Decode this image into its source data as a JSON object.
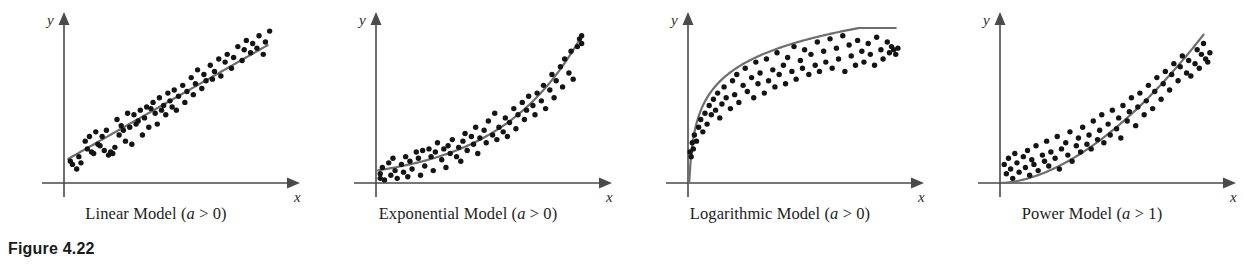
{
  "figure": {
    "number_label": "Figure 4.22",
    "axis_x_label": "x",
    "axis_y_label": "y",
    "curve_color": "#6e6e6e",
    "point_color": "#141414",
    "axis_color": "#4a4a4a",
    "background_color": "#ffffff"
  },
  "panels": [
    {
      "id": "linear",
      "caption_prefix": "Linear Model (",
      "caption_param": "a",
      "caption_suffix": " > 0)",
      "caption_full": "Linear Model (a > 0)"
    },
    {
      "id": "exponential",
      "caption_prefix": "Exponential Model (",
      "caption_param": "a",
      "caption_suffix": " > 0)",
      "caption_full": "Exponential Model (a > 0)"
    },
    {
      "id": "logarithmic",
      "caption_prefix": "Logarithmic Model (",
      "caption_param": "a",
      "caption_suffix": " > 0)",
      "caption_full": "Logarithmic Model (a > 0)"
    },
    {
      "id": "power",
      "caption_prefix": "Power Model (",
      "caption_param": "a",
      "caption_suffix": " > 1)",
      "caption_full": "Power Model (a > 1)"
    }
  ],
  "chart_data": [
    {
      "type": "scatter",
      "id": "linear",
      "title": "Linear Model (a > 0)",
      "xlabel": "x",
      "ylabel": "y",
      "xlim": [
        0,
        100
      ],
      "ylim": [
        0,
        100
      ],
      "grid": false,
      "legend": null,
      "annotation": "a > 0",
      "fit": {
        "name": "linear fit",
        "equation": "y = a*x + b",
        "a": 0.78,
        "b": 14,
        "color": "#6e6e6e",
        "x_start": 2,
        "x_end": 96
      },
      "points": [
        [
          3,
          14
        ],
        [
          4,
          12
        ],
        [
          6,
          9
        ],
        [
          7,
          17
        ],
        [
          8,
          13
        ],
        [
          10,
          27
        ],
        [
          11,
          22
        ],
        [
          12,
          30
        ],
        [
          13,
          20
        ],
        [
          14,
          19
        ],
        [
          15,
          33
        ],
        [
          16,
          25
        ],
        [
          17,
          24
        ],
        [
          18,
          30
        ],
        [
          19,
          21
        ],
        [
          20,
          34
        ],
        [
          21,
          18
        ],
        [
          22,
          20
        ],
        [
          23,
          19
        ],
        [
          24,
          23
        ],
        [
          25,
          41
        ],
        [
          26,
          31
        ],
        [
          27,
          37
        ],
        [
          28,
          34
        ],
        [
          29,
          27
        ],
        [
          30,
          45
        ],
        [
          31,
          36
        ],
        [
          32,
          25
        ],
        [
          33,
          44
        ],
        [
          34,
          38
        ],
        [
          35,
          40
        ],
        [
          36,
          47
        ],
        [
          37,
          31
        ],
        [
          38,
          42
        ],
        [
          39,
          49
        ],
        [
          40,
          36
        ],
        [
          41,
          48
        ],
        [
          42,
          52
        ],
        [
          43,
          45
        ],
        [
          44,
          38
        ],
        [
          45,
          55
        ],
        [
          46,
          47
        ],
        [
          47,
          50
        ],
        [
          48,
          44
        ],
        [
          49,
          58
        ],
        [
          50,
          53
        ],
        [
          51,
          49
        ],
        [
          52,
          60
        ],
        [
          53,
          47
        ],
        [
          54,
          56
        ],
        [
          56,
          63
        ],
        [
          57,
          52
        ],
        [
          58,
          59
        ],
        [
          60,
          68
        ],
        [
          61,
          57
        ],
        [
          62,
          64
        ],
        [
          63,
          73
        ],
        [
          65,
          61
        ],
        [
          66,
          70
        ],
        [
          67,
          66
        ],
        [
          69,
          76
        ],
        [
          70,
          67
        ],
        [
          71,
          72
        ],
        [
          73,
          80
        ],
        [
          74,
          69
        ],
        [
          76,
          78
        ],
        [
          77,
          83
        ],
        [
          79,
          74
        ],
        [
          80,
          81
        ],
        [
          82,
          88
        ],
        [
          84,
          79
        ],
        [
          85,
          86
        ],
        [
          86,
          92
        ],
        [
          88,
          84
        ],
        [
          89,
          90
        ],
        [
          91,
          87
        ],
        [
          92,
          95
        ],
        [
          94,
          83
        ],
        [
          95,
          91
        ],
        [
          97,
          98
        ]
      ]
    },
    {
      "type": "scatter",
      "id": "exponential",
      "title": "Exponential Model (a > 0)",
      "xlabel": "x",
      "ylabel": "y",
      "xlim": [
        0,
        100
      ],
      "ylim": [
        0,
        100
      ],
      "grid": false,
      "legend": null,
      "annotation": "a > 0",
      "fit": {
        "name": "exponential fit",
        "equation": "y = a*exp(b*x)",
        "a": 8,
        "b": 0.0255,
        "color": "#6e6e6e",
        "x_start": 1,
        "x_end": 97
      },
      "points": [
        [
          2,
          6
        ],
        [
          2,
          3
        ],
        [
          3,
          10
        ],
        [
          4,
          2
        ],
        [
          6,
          13
        ],
        [
          7,
          5
        ],
        [
          8,
          16
        ],
        [
          9,
          8
        ],
        [
          10,
          3
        ],
        [
          12,
          12
        ],
        [
          13,
          7
        ],
        [
          14,
          17
        ],
        [
          15,
          4
        ],
        [
          16,
          14
        ],
        [
          17,
          9
        ],
        [
          19,
          20
        ],
        [
          20,
          16
        ],
        [
          21,
          5
        ],
        [
          22,
          21
        ],
        [
          23,
          11
        ],
        [
          25,
          22
        ],
        [
          26,
          17
        ],
        [
          27,
          8
        ],
        [
          28,
          20
        ],
        [
          29,
          26
        ],
        [
          31,
          15
        ],
        [
          32,
          22
        ],
        [
          33,
          10
        ],
        [
          34,
          24
        ],
        [
          35,
          19
        ],
        [
          36,
          28
        ],
        [
          38,
          17
        ],
        [
          39,
          23
        ],
        [
          40,
          14
        ],
        [
          41,
          27
        ],
        [
          42,
          32
        ],
        [
          43,
          21
        ],
        [
          45,
          30
        ],
        [
          46,
          25
        ],
        [
          47,
          36
        ],
        [
          48,
          19
        ],
        [
          49,
          29
        ],
        [
          51,
          34
        ],
        [
          52,
          26
        ],
        [
          53,
          40
        ],
        [
          55,
          31
        ],
        [
          56,
          45
        ],
        [
          57,
          28
        ],
        [
          58,
          36
        ],
        [
          60,
          33
        ],
        [
          61,
          42
        ],
        [
          62,
          30
        ],
        [
          63,
          39
        ],
        [
          65,
          48
        ],
        [
          66,
          35
        ],
        [
          67,
          44
        ],
        [
          69,
          52
        ],
        [
          70,
          41
        ],
        [
          71,
          47
        ],
        [
          72,
          56
        ],
        [
          74,
          50
        ],
        [
          75,
          44
        ],
        [
          76,
          58
        ],
        [
          78,
          53
        ],
        [
          79,
          63
        ],
        [
          80,
          48
        ],
        [
          82,
          60
        ],
        [
          83,
          70
        ],
        [
          84,
          55
        ],
        [
          85,
          66
        ],
        [
          87,
          75
        ],
        [
          88,
          62
        ],
        [
          89,
          80
        ],
        [
          91,
          71
        ],
        [
          92,
          85
        ],
        [
          93,
          67
        ],
        [
          95,
          88
        ],
        [
          96,
          93
        ],
        [
          97,
          95
        ],
        [
          97,
          90
        ]
      ]
    },
    {
      "type": "scatter",
      "id": "logarithmic",
      "title": "Logarithmic Model (a > 0)",
      "xlabel": "x",
      "ylabel": "y",
      "xlim": [
        0,
        100
      ],
      "ylim": [
        0,
        100
      ],
      "grid": false,
      "legend": null,
      "annotation": "a > 0",
      "fit": {
        "name": "logarithmic fit",
        "equation": "y = a*ln(x) + b",
        "a": 20.5,
        "b": 10,
        "color": "#6e6e6e",
        "x_start": 0.55,
        "x_end": 98
      },
      "points": [
        [
          1,
          20
        ],
        [
          1.5,
          17
        ],
        [
          2,
          26
        ],
        [
          2.5,
          22
        ],
        [
          3,
          31
        ],
        [
          4,
          27
        ],
        [
          5,
          36
        ],
        [
          6,
          41
        ],
        [
          7,
          33
        ],
        [
          8,
          45
        ],
        [
          9,
          38
        ],
        [
          10,
          50
        ],
        [
          11,
          44
        ],
        [
          12,
          54
        ],
        [
          13,
          47
        ],
        [
          14,
          58
        ],
        [
          15,
          42
        ],
        [
          16,
          51
        ],
        [
          17,
          62
        ],
        [
          18,
          55
        ],
        [
          20,
          48
        ],
        [
          21,
          66
        ],
        [
          22,
          57
        ],
        [
          23,
          70
        ],
        [
          24,
          52
        ],
        [
          26,
          63
        ],
        [
          27,
          74
        ],
        [
          28,
          59
        ],
        [
          30,
          68
        ],
        [
          31,
          55
        ],
        [
          32,
          78
        ],
        [
          33,
          64
        ],
        [
          34,
          71
        ],
        [
          36,
          58
        ],
        [
          37,
          80
        ],
        [
          38,
          66
        ],
        [
          40,
          73
        ],
        [
          41,
          62
        ],
        [
          42,
          84
        ],
        [
          43,
          70
        ],
        [
          45,
          76
        ],
        [
          46,
          64
        ],
        [
          47,
          81
        ],
        [
          49,
          72
        ],
        [
          50,
          88
        ],
        [
          51,
          67
        ],
        [
          53,
          79
        ],
        [
          54,
          74
        ],
        [
          55,
          86
        ],
        [
          57,
          70
        ],
        [
          58,
          83
        ],
        [
          60,
          76
        ],
        [
          61,
          91
        ],
        [
          62,
          72
        ],
        [
          64,
          85
        ],
        [
          65,
          78
        ],
        [
          67,
          93
        ],
        [
          68,
          74
        ],
        [
          70,
          87
        ],
        [
          71,
          80
        ],
        [
          73,
          95
        ],
        [
          74,
          72
        ],
        [
          76,
          89
        ],
        [
          77,
          82
        ],
        [
          79,
          76
        ],
        [
          80,
          92
        ],
        [
          82,
          85
        ],
        [
          83,
          78
        ],
        [
          85,
          90
        ],
        [
          86,
          83
        ],
        [
          88,
          76
        ],
        [
          89,
          94
        ],
        [
          91,
          86
        ],
        [
          92,
          80
        ],
        [
          94,
          91
        ],
        [
          95,
          84
        ],
        [
          96,
          88
        ],
        [
          97,
          86
        ],
        [
          98,
          83
        ],
        [
          99,
          87
        ]
      ]
    },
    {
      "type": "scatter",
      "id": "power",
      "title": "Power Model (a > 1)",
      "xlabel": "x",
      "ylabel": "y",
      "xlim": [
        0,
        100
      ],
      "ylim": [
        0,
        100
      ],
      "grid": false,
      "legend": null,
      "annotation": "a > 1",
      "fit": {
        "name": "power fit",
        "equation": "y = c*x^a",
        "a": 1.75,
        "c": 0.0325,
        "color": "#6e6e6e",
        "x_start": 1,
        "x_end": 96
      },
      "points": [
        [
          2,
          12
        ],
        [
          3,
          6
        ],
        [
          4,
          16
        ],
        [
          5,
          9
        ],
        [
          6,
          3
        ],
        [
          7,
          19
        ],
        [
          8,
          13
        ],
        [
          9,
          7
        ],
        [
          11,
          17
        ],
        [
          12,
          10
        ],
        [
          13,
          21
        ],
        [
          14,
          5
        ],
        [
          15,
          15
        ],
        [
          16,
          12
        ],
        [
          17,
          24
        ],
        [
          18,
          8
        ],
        [
          20,
          18
        ],
        [
          21,
          14
        ],
        [
          22,
          27
        ],
        [
          23,
          11
        ],
        [
          24,
          20
        ],
        [
          26,
          16
        ],
        [
          27,
          30
        ],
        [
          28,
          9
        ],
        [
          29,
          22
        ],
        [
          31,
          26
        ],
        [
          32,
          18
        ],
        [
          33,
          33
        ],
        [
          34,
          14
        ],
        [
          36,
          24
        ],
        [
          37,
          29
        ],
        [
          38,
          20
        ],
        [
          39,
          36
        ],
        [
          41,
          25
        ],
        [
          42,
          31
        ],
        [
          43,
          22
        ],
        [
          44,
          40
        ],
        [
          46,
          28
        ],
        [
          47,
          34
        ],
        [
          48,
          44
        ],
        [
          49,
          26
        ],
        [
          51,
          38
        ],
        [
          52,
          31
        ],
        [
          53,
          47
        ],
        [
          55,
          35
        ],
        [
          56,
          42
        ],
        [
          57,
          29
        ],
        [
          58,
          50
        ],
        [
          60,
          40
        ],
        [
          61,
          46
        ],
        [
          62,
          55
        ],
        [
          64,
          37
        ],
        [
          65,
          49
        ],
        [
          66,
          58
        ],
        [
          68,
          44
        ],
        [
          69,
          53
        ],
        [
          70,
          63
        ],
        [
          72,
          48
        ],
        [
          73,
          59
        ],
        [
          74,
          68
        ],
        [
          76,
          54
        ],
        [
          77,
          64
        ],
        [
          78,
          72
        ],
        [
          80,
          60
        ],
        [
          81,
          70
        ],
        [
          82,
          77
        ],
        [
          84,
          66
        ],
        [
          85,
          75
        ],
        [
          86,
          82
        ],
        [
          88,
          71
        ],
        [
          89,
          79
        ],
        [
          90,
          69
        ],
        [
          92,
          77
        ],
        [
          93,
          86
        ],
        [
          94,
          74
        ],
        [
          95,
          83
        ],
        [
          96,
          90
        ],
        [
          97,
          80
        ],
        [
          98,
          78
        ],
        [
          99,
          84
        ]
      ]
    }
  ]
}
